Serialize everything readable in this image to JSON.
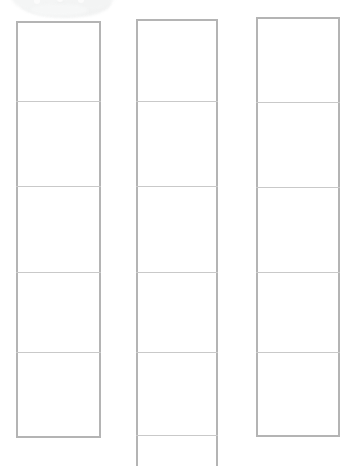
{
  "canvas": {
    "width": 347,
    "height": 466,
    "background_color": "#ffffff",
    "border_color": "#b4b4b4",
    "divider_color": "#c9c9c9",
    "smudge_color": "#f2f3f3"
  },
  "artifact": {
    "name": "smudge-blob",
    "label": "",
    "x": 19,
    "y": -20,
    "width": 92,
    "height": 38
  },
  "columns": [
    {
      "id": "column-1",
      "label": "",
      "x": 16,
      "y": 21,
      "width": 85,
      "height": 417,
      "open_bottom": false,
      "dividers": [
        101,
        186,
        272,
        352
      ],
      "cells": [
        {
          "label": "",
          "top": 21,
          "bottom": 101
        },
        {
          "label": "",
          "top": 101,
          "bottom": 186
        },
        {
          "label": "",
          "top": 186,
          "bottom": 272
        },
        {
          "label": "",
          "top": 272,
          "bottom": 352
        },
        {
          "label": "",
          "top": 352,
          "bottom": 438
        }
      ]
    },
    {
      "id": "column-2",
      "label": "",
      "x": 136,
      "y": 19,
      "width": 82,
      "height": 447,
      "open_bottom": true,
      "dividers": [
        101,
        186,
        272,
        352,
        435
      ],
      "cells": [
        {
          "label": "",
          "top": 19,
          "bottom": 101
        },
        {
          "label": "",
          "top": 101,
          "bottom": 186
        },
        {
          "label": "",
          "top": 186,
          "bottom": 272
        },
        {
          "label": "",
          "top": 272,
          "bottom": 352
        },
        {
          "label": "",
          "top": 352,
          "bottom": 435
        },
        {
          "label": "",
          "top": 435,
          "bottom": 466
        }
      ]
    },
    {
      "id": "column-3",
      "label": "",
      "x": 256,
      "y": 17,
      "width": 84,
      "height": 420,
      "open_bottom": false,
      "dividers": [
        102,
        187,
        272,
        352
      ],
      "cells": [
        {
          "label": "",
          "top": 17,
          "bottom": 102
        },
        {
          "label": "",
          "top": 102,
          "bottom": 187
        },
        {
          "label": "",
          "top": 187,
          "bottom": 272
        },
        {
          "label": "",
          "top": 272,
          "bottom": 352
        },
        {
          "label": "",
          "top": 352,
          "bottom": 437
        }
      ]
    }
  ],
  "specks": [
    {
      "x": 34,
      "y": -2,
      "r": 3
    },
    {
      "x": 57,
      "y": -4,
      "r": 3
    },
    {
      "x": 78,
      "y": -3,
      "r": 3
    },
    {
      "x": 96,
      "y": -8,
      "r": 3
    },
    {
      "x": 46,
      "y": -10,
      "r": 2
    }
  ]
}
